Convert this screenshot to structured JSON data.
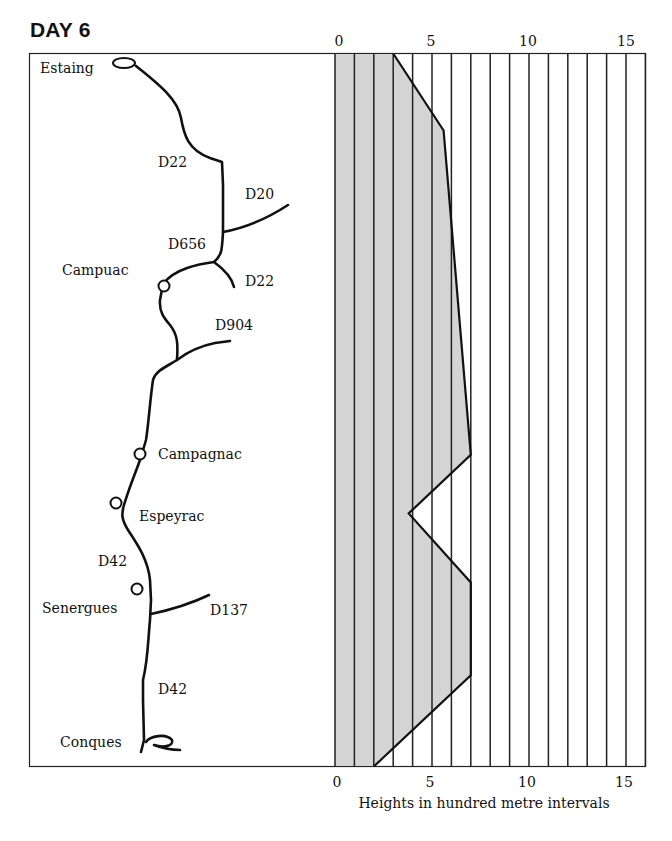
{
  "title": "DAY 6",
  "map": {
    "places": [
      {
        "name": "Estaing",
        "x": 40,
        "y": 73
      },
      {
        "name": "Campuac",
        "x": 62,
        "y": 275
      },
      {
        "name": "Campagnac",
        "x": 158,
        "y": 459
      },
      {
        "name": "Espeyrac",
        "x": 139,
        "y": 521
      },
      {
        "name": "Senergues",
        "x": 42,
        "y": 613
      },
      {
        "name": "Conques",
        "x": 60,
        "y": 747
      }
    ],
    "roads": [
      {
        "name": "D22",
        "x": 158,
        "y": 167
      },
      {
        "name": "D20",
        "x": 245,
        "y": 199
      },
      {
        "name": "D656",
        "x": 168,
        "y": 249
      },
      {
        "name": "D22",
        "x": 245,
        "y": 286
      },
      {
        "name": "D904",
        "x": 215,
        "y": 330
      },
      {
        "name": "D42",
        "x": 98,
        "y": 566
      },
      {
        "name": "D137",
        "x": 210,
        "y": 615
      },
      {
        "name": "D42",
        "x": 158,
        "y": 694
      }
    ]
  },
  "chart_data": {
    "type": "area",
    "title": "DAY 6",
    "xlabel": "Heights in hundred metre intervals",
    "ylabel": "",
    "orientation": "vertical-profile (distance runs top to bottom, height along x-axis)",
    "xlim": [
      0,
      16
    ],
    "x_ticks": [
      0,
      5,
      10,
      15
    ],
    "grid": "vertical lines at every 1 unit",
    "fill_color": "#d4d4d4",
    "profile": [
      {
        "place": "Estaing",
        "height": 3.0,
        "pos": 0.0
      },
      {
        "place": "",
        "height": 5.6,
        "pos": 0.108
      },
      {
        "place": "Campagnac",
        "height": 7.0,
        "pos": 0.563
      },
      {
        "place": "Espeyrac",
        "height": 3.8,
        "pos": 0.645
      },
      {
        "place": "Senergues",
        "height": 7.0,
        "pos": 0.742
      },
      {
        "place": "",
        "height": 7.0,
        "pos": 0.872
      },
      {
        "place": "Conques",
        "height": 2.0,
        "pos": 1.0
      }
    ]
  },
  "axis": {
    "top_ticks": [
      "0",
      "5",
      "10",
      "15"
    ],
    "bottom_ticks": [
      "0",
      "5",
      "10",
      "15"
    ],
    "label": "Heights in hundred metre intervals"
  }
}
